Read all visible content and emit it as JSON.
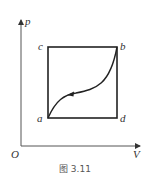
{
  "diagram": {
    "type": "p-V cycle diagram",
    "axes": {
      "y_label": "p",
      "x_label": "V",
      "origin_label": "O"
    },
    "points": [
      {
        "label": "c",
        "position": "top-left"
      },
      {
        "label": "b",
        "position": "top-right"
      },
      {
        "label": "a",
        "position": "bottom-left"
      },
      {
        "label": "d",
        "position": "bottom-right"
      }
    ],
    "curve": {
      "from": "b",
      "to": "a",
      "direction_arrow": "toward a"
    },
    "caption": "图 3.11"
  }
}
